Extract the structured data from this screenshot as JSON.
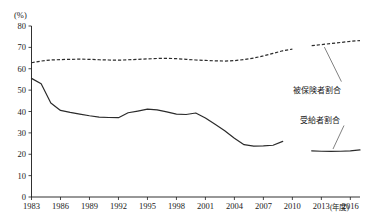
{
  "chart_data": {
    "type": "line",
    "title": "",
    "xlabel": "年度",
    "ylabel": "(%)",
    "xlim": [
      1983,
      2017
    ],
    "ylim": [
      0,
      80
    ],
    "grid": false,
    "legend_position": "inline-right",
    "y_ticks": [
      "0",
      "10",
      "20",
      "30",
      "40",
      "50",
      "60",
      "70",
      "80"
    ],
    "x_ticks": [
      "1983",
      "1986",
      "1989",
      "1992",
      "1995",
      "1998",
      "2001",
      "2004",
      "2007",
      "2010",
      "2013",
      "2016"
    ],
    "x_axis_unit": "(年度)",
    "y_axis_unit": "(%)",
    "series": [
      {
        "name": "被保険者割合",
        "style": "dashed",
        "segments": [
          {
            "x": [
              1983,
              1984,
              1985,
              1986,
              1987,
              1988,
              1989,
              1990,
              1991,
              1992,
              1993,
              1994,
              1995,
              1996,
              1997,
              1998,
              1999,
              2000,
              2001,
              2002,
              2003,
              2004,
              2005,
              2006,
              2007,
              2008,
              2009,
              2010
            ],
            "values": [
              62.8,
              63.6,
              64.1,
              64.3,
              64.4,
              64.5,
              64.4,
              64.2,
              64.1,
              64.0,
              64.2,
              64.4,
              64.6,
              64.8,
              64.9,
              64.7,
              64.4,
              64.1,
              63.9,
              63.7,
              63.6,
              63.8,
              64.3,
              65.0,
              66.0,
              67.2,
              68.4,
              69.2
            ]
          },
          {
            "x": [
              2012,
              2013,
              2014,
              2015,
              2016,
              2017
            ],
            "values": [
              70.8,
              71.3,
              71.8,
              72.3,
              72.8,
              73.2
            ]
          }
        ]
      },
      {
        "name": "受給者割合",
        "style": "solid",
        "segments": [
          {
            "x": [
              1983,
              1984,
              1985,
              1986,
              1987,
              1988,
              1989,
              1990,
              1991,
              1992,
              1993,
              1994,
              1995,
              1996,
              1997,
              1998,
              1999,
              2000,
              2001,
              2002,
              2003,
              2004,
              2005,
              2006,
              2007,
              2008,
              2009
            ],
            "values": [
              55.5,
              53.0,
              44.0,
              40.5,
              39.6,
              38.8,
              38.0,
              37.4,
              37.2,
              37.1,
              39.4,
              40.2,
              41.1,
              40.8,
              39.8,
              38.8,
              38.6,
              39.3,
              37.0,
              34.0,
              31.0,
              27.5,
              24.5,
              23.8,
              23.9,
              24.2,
              26.0
            ]
          },
          {
            "x": [
              2012,
              2013,
              2014,
              2015,
              2016,
              2017
            ],
            "values": [
              21.6,
              21.4,
              21.3,
              21.4,
              21.6,
              22.0
            ]
          }
        ]
      }
    ],
    "annotations": [
      {
        "text": "被保険者割合",
        "target_series": "被保険者割合"
      },
      {
        "text": "受給者割合",
        "target_series": "受給者割合"
      }
    ]
  }
}
